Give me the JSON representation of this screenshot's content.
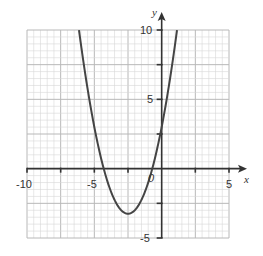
{
  "chart_data": {
    "type": "line",
    "title": "",
    "xlabel": "x",
    "ylabel": "y",
    "xlim": [
      -10,
      5
    ],
    "ylim": [
      -5,
      10
    ],
    "grid": true,
    "grid_minor_step": 0.5,
    "grid_major_step": 2.5,
    "x_tick_labels": [
      "-10",
      "-5",
      "0",
      "5"
    ],
    "y_tick_labels": [
      "10",
      "5",
      "-5"
    ],
    "series": [
      {
        "name": "y = x^2 + 5x + 3",
        "equation": "y = x^2 + 5x + 3",
        "vertex": [
          -2.5,
          -3.25
        ],
        "roots": [
          -4.3,
          -0.7
        ],
        "y_intercept": 3,
        "x": [
          -6.14,
          -6,
          -5.5,
          -5,
          -4.5,
          -4,
          -3.5,
          -3,
          -2.5,
          -2,
          -1.5,
          -1,
          -0.5,
          0,
          0.5,
          1,
          1.14
        ],
        "values": [
          10,
          9,
          5.75,
          3,
          0.75,
          -1,
          -2.25,
          -3,
          -3.25,
          -3,
          -2.25,
          -1,
          0.75,
          3,
          5.75,
          9,
          10
        ]
      }
    ]
  },
  "labels": {
    "x_axis": "x",
    "y_axis": "y",
    "x_neg10": "-10",
    "x_neg5": "-5",
    "origin": "0",
    "x_5": "5",
    "y_10": "10",
    "y_5": "5",
    "y_neg5": "-5"
  },
  "colors": {
    "grid_minor": "#d6d6d6",
    "grid_major": "#b8b8b8",
    "axis": "#333333",
    "curve": "#444444"
  }
}
